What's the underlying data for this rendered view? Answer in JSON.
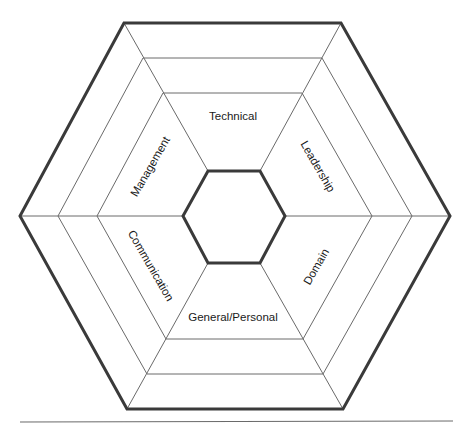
{
  "diagram": {
    "type": "concentric-hexagon",
    "segments": [
      {
        "id": "technical",
        "label": "Technical",
        "position": "top"
      },
      {
        "id": "leadership",
        "label": "Leadership",
        "position": "upper-right"
      },
      {
        "id": "domain",
        "label": "Domain",
        "position": "lower-right"
      },
      {
        "id": "general-personal",
        "label": "General/Personal",
        "position": "bottom"
      },
      {
        "id": "communication",
        "label": "Communication",
        "position": "lower-left"
      },
      {
        "id": "management",
        "label": "Management",
        "position": "upper-left"
      }
    ],
    "rings": 4,
    "colors": {
      "outline": "#3a3a3a",
      "lines": "#6a6a6a",
      "text": "#1a1a1a",
      "background": "#ffffff"
    }
  }
}
